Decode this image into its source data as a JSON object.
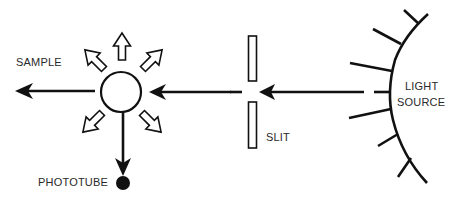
{
  "diagram": {
    "type": "fluorescence-spectroscopy-schematic",
    "labels": {
      "sample": "SAMPLE",
      "phototube": "PHOTOTUBE",
      "slit": "SLIT",
      "light_line1": "LIGHT",
      "light_line2": "SOURCE"
    },
    "nodes": [
      {
        "id": "light-source",
        "shape": "arc-with-rays",
        "label": "LIGHT SOURCE"
      },
      {
        "id": "slit",
        "shape": "two-bars",
        "label": "SLIT"
      },
      {
        "id": "sample",
        "shape": "circle",
        "label": "SAMPLE"
      },
      {
        "id": "phototube",
        "shape": "dot",
        "label": "PHOTOTUBE"
      }
    ],
    "edges": [
      {
        "from": "light-source",
        "to": "slit",
        "style": "solid-arrow"
      },
      {
        "from": "slit",
        "to": "sample",
        "style": "solid-arrow"
      },
      {
        "from": "sample",
        "to": "left",
        "style": "solid-arrow",
        "meaning": "transmitted light"
      },
      {
        "from": "sample",
        "to": "phototube",
        "style": "solid-arrow"
      },
      {
        "from": "sample",
        "to": "radial",
        "style": "hollow-arrows",
        "count": 5,
        "meaning": "emitted/scattered light"
      }
    ],
    "colors": {
      "ink": "#111111",
      "text": "#2a2a2a",
      "background": "#ffffff"
    }
  }
}
